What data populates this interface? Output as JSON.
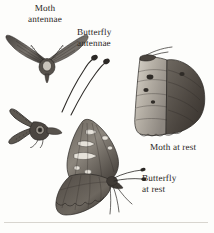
{
  "plate": {
    "title_semantic": "moth-and-butterfly-comparison-plate",
    "background_color": "#fdfdfb",
    "ink_color": "#2a2724",
    "width": 214,
    "height": 233
  },
  "labels": [
    {
      "id": "moth-antennae",
      "text": "Moth\nantennae",
      "x": 28,
      "y": 4,
      "align": "center"
    },
    {
      "id": "butterfly-antennae",
      "text": "Butterfly\nantennae",
      "x": 77,
      "y": 28,
      "align": "left"
    },
    {
      "id": "moth-at-rest",
      "text": "Moth at rest",
      "x": 151,
      "y": 143,
      "align": "left"
    },
    {
      "id": "butterfly-at-rest",
      "text": "Butterfly\nat rest",
      "x": 143,
      "y": 174,
      "align": "left"
    }
  ],
  "figures": [
    {
      "id": "moth-wings-spread",
      "caption_ref": "moth-antennae",
      "description": "moth with wings spread and bipectinate feathery antennae",
      "x": 4,
      "y": 26,
      "width": 84,
      "height": 56
    },
    {
      "id": "butterfly-antennae-detail",
      "caption_ref": "butterfly-antennae",
      "description": "two detached clubbed butterfly antennae",
      "x": 60,
      "y": 55,
      "width": 50,
      "height": 60
    },
    {
      "id": "moth-head-detail",
      "caption_ref": "moth-antennae",
      "description": "moth head in profile with plumose antennae",
      "x": 2,
      "y": 100,
      "width": 62,
      "height": 46
    },
    {
      "id": "moth-at-rest-figure",
      "caption_ref": "moth-at-rest",
      "description": "moth at rest with wings folded in a roof-like triangle",
      "x": 128,
      "y": 46,
      "width": 82,
      "height": 96
    },
    {
      "id": "butterfly-at-rest-figure",
      "caption_ref": "butterfly-at-rest",
      "description": "butterfly at rest with wings held vertically above the body",
      "x": 52,
      "y": 112,
      "width": 92,
      "height": 110
    }
  ],
  "rule": {
    "id": "baseline-rule",
    "visible": true
  }
}
